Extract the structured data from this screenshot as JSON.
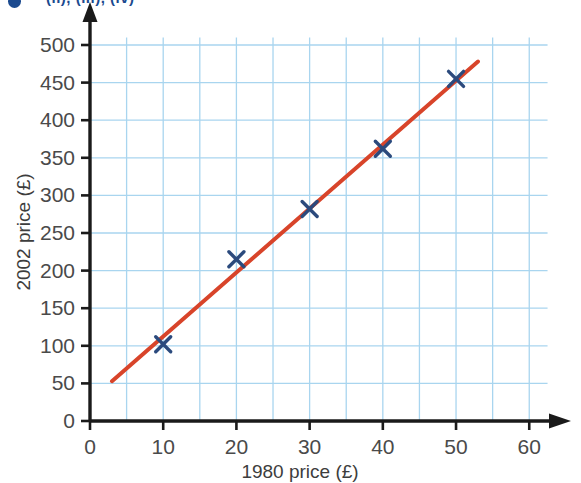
{
  "header": {
    "bullet_icon": "bullet-dot-icon",
    "fragment_text": "(ii), (iii), (iv)"
  },
  "colors": {
    "marker": "#2b4a7d",
    "trend_line": "#d8442a",
    "grid": "#a9d5ef",
    "axis": "#1a1a1a",
    "text": "#4a4a4a",
    "header_accent": "#1b4a8f"
  },
  "chart_data": {
    "type": "scatter",
    "title": "",
    "xlabel": "1980 price (£)",
    "ylabel": "2002 price (£)",
    "xlim": [
      0,
      65
    ],
    "ylim": [
      0,
      525
    ],
    "grid": true,
    "grid_step_x": 5,
    "grid_step_y": 50,
    "xticks": [
      0,
      10,
      20,
      30,
      40,
      50,
      60
    ],
    "xtick_labels": [
      "0",
      "10",
      "20",
      "30",
      "40",
      "50",
      "60"
    ],
    "yticks": [
      0,
      50,
      100,
      150,
      200,
      250,
      300,
      350,
      400,
      450,
      500
    ],
    "ytick_labels": [
      "0",
      "50",
      "100",
      "150",
      "200",
      "250",
      "300",
      "350",
      "400",
      "450",
      "500"
    ],
    "legend": null,
    "series": [
      {
        "name": "Price comparison",
        "type": "scatter",
        "marker": "x",
        "color": "#2b4a7d",
        "x": [
          10,
          20,
          30,
          40,
          50
        ],
        "y": [
          102,
          215,
          282,
          362,
          455
        ],
        "points": [
          {
            "x": 10,
            "y": 102
          },
          {
            "x": 20,
            "y": 215
          },
          {
            "x": 30,
            "y": 282
          },
          {
            "x": 40,
            "y": 362
          },
          {
            "x": 50,
            "y": 455
          }
        ]
      },
      {
        "name": "Line of best fit",
        "type": "line",
        "color": "#d8442a",
        "x": [
          3,
          53
        ],
        "y": [
          53,
          478
        ]
      }
    ]
  }
}
